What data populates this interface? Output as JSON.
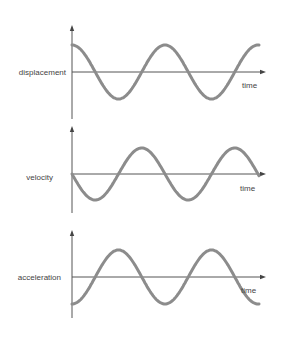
{
  "diagram": {
    "title": "",
    "colors": {
      "background": "#ffffff",
      "axis": "#555555",
      "wave": "#8c8c8c",
      "text": "#444444"
    },
    "x_axis_label": "time",
    "panels": [
      {
        "id": "displacement",
        "label": "displacement",
        "function": "cos",
        "phase": "starts at maximum",
        "axis_y": 72,
        "y_axis_top": 25,
        "y_axis_bottom": 119,
        "amplitude": 27,
        "label_x": 66,
        "label_y": 75,
        "time_label_x": 242,
        "time_label_y": 88
      },
      {
        "id": "velocity",
        "label": "velocity",
        "function": "-sin",
        "phase": "starts at zero, going negative",
        "axis_y": 174,
        "y_axis_top": 126,
        "y_axis_bottom": 213,
        "amplitude": 26,
        "label_x": 53,
        "label_y": 180,
        "time_label_x": 240,
        "time_label_y": 191
      },
      {
        "id": "acceleration",
        "label": "acceleration",
        "function": "-cos",
        "phase": "starts at minimum",
        "axis_y": 277,
        "y_axis_top": 230,
        "y_axis_bottom": 318,
        "amplitude": 27,
        "label_x": 61,
        "label_y": 280,
        "time_label_x": 241,
        "time_label_y": 293
      }
    ],
    "x_axis": {
      "x_start": 72,
      "x_end": 266
    },
    "wave": {
      "x_start": 72,
      "x_end": 259,
      "period_px": 93,
      "cycles_shown": 2
    }
  }
}
